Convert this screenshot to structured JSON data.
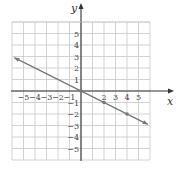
{
  "chart_data": {
    "type": "line",
    "title": "",
    "xlabel": "x",
    "ylabel": "y",
    "xlim": [
      -6,
      6
    ],
    "ylim": [
      -6,
      6
    ],
    "grid": true,
    "x_ticks": [
      -5,
      -4,
      -3,
      -2,
      -1,
      2,
      3,
      4,
      5
    ],
    "y_ticks": [
      5,
      4,
      3,
      2,
      1,
      -1,
      -2,
      -3,
      -4,
      -5
    ],
    "series": [
      {
        "name": "y = -x/2",
        "equation": "y = -x/2",
        "x_range": [
          -5.8,
          5.8
        ],
        "arrows": "both",
        "points": [
          [
            0,
            0
          ],
          [
            2,
            -1
          ],
          [
            4,
            -2
          ]
        ],
        "color": "#777777"
      }
    ]
  },
  "style": {
    "grid_color": "#c8c8c8",
    "axis_color": "#333333",
    "line_color": "#777777"
  }
}
